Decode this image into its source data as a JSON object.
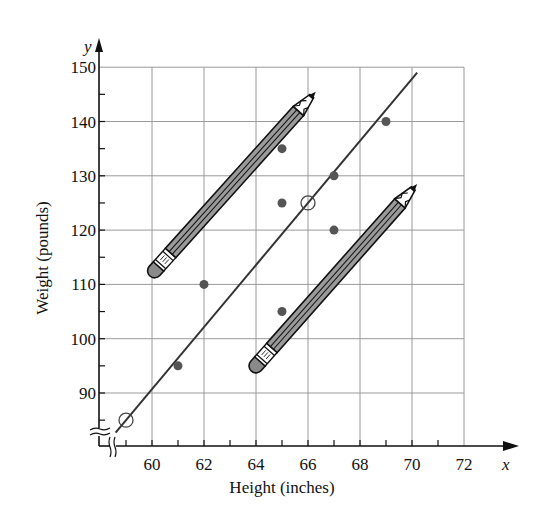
{
  "chart_data": {
    "type": "scatter",
    "title": "",
    "xlabel": "Height (inches)",
    "ylabel": "Weight (pounds)",
    "x_axis_var": "x",
    "y_axis_var": "y",
    "xlim": [
      58,
      73
    ],
    "ylim": [
      82,
      150
    ],
    "x_ticks": [
      60,
      62,
      64,
      66,
      68,
      70,
      72
    ],
    "y_ticks": [
      90,
      100,
      110,
      120,
      130,
      140,
      150
    ],
    "grid": true,
    "axis_breaks": [
      "x",
      "y"
    ],
    "series": [
      {
        "name": "data points",
        "marker": "filled-circle",
        "color": "#555555",
        "points": [
          {
            "x": 61,
            "y": 95
          },
          {
            "x": 62,
            "y": 110
          },
          {
            "x": 65,
            "y": 135
          },
          {
            "x": 65,
            "y": 125
          },
          {
            "x": 65,
            "y": 105
          },
          {
            "x": 67,
            "y": 130
          },
          {
            "x": 67,
            "y": 120
          },
          {
            "x": 69,
            "y": 140
          }
        ]
      },
      {
        "name": "line-fit points",
        "marker": "open-circle",
        "points": [
          {
            "x": 59,
            "y": 85
          },
          {
            "x": 66,
            "y": 125
          }
        ]
      }
    ],
    "fit_line": {
      "through": [
        {
          "x": 59,
          "y": 85
        },
        {
          "x": 66,
          "y": 125
        }
      ],
      "x_range": [
        58.6,
        70.2
      ]
    },
    "annotations": [
      {
        "type": "pencil",
        "from": {
          "x": 60.1,
          "y": 112.5
        },
        "to": {
          "x": 66.3,
          "y": 145.5
        }
      },
      {
        "type": "pencil",
        "from": {
          "x": 64,
          "y": 95
        },
        "to": {
          "x": 70.2,
          "y": 128.5
        }
      }
    ]
  }
}
